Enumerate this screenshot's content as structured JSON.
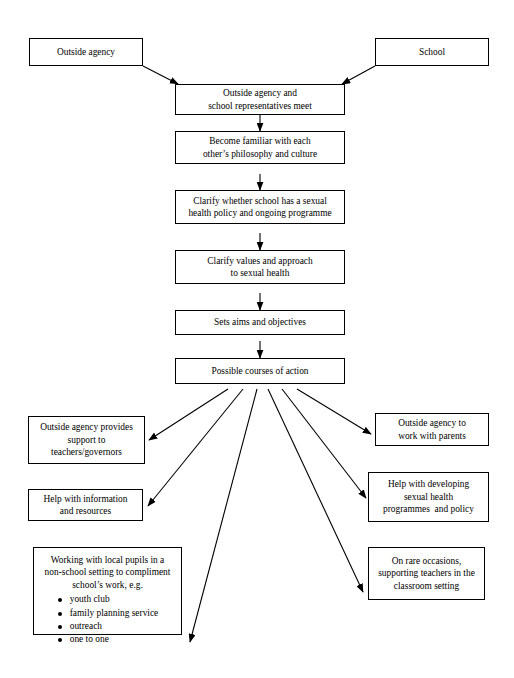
{
  "diagram": {
    "stroke_color": "#000000",
    "fill_color": "#ffffff",
    "nodes": {
      "outside_agency": {
        "lines": [
          "Outside agency"
        ]
      },
      "school": {
        "lines": [
          "School"
        ]
      },
      "meet": {
        "lines": [
          "Outside agency and",
          "school representatives meet"
        ]
      },
      "familiar": {
        "lines": [
          "Become familiar with each",
          "other’s philosophy and culture"
        ]
      },
      "clarify_policy": {
        "lines": [
          "Clarify whether school has a sexual",
          "health policy and ongoing programme"
        ]
      },
      "clarify_values": {
        "lines": [
          "Clarify values and approach",
          "to sexual health"
        ]
      },
      "aims": {
        "lines": [
          "Sets aims and objectives"
        ]
      },
      "possible": {
        "lines": [
          "Possible courses of action"
        ]
      },
      "support_teachers": {
        "lines": [
          "Outside agency provides",
          "support to",
          "teachers/governors"
        ]
      },
      "help_information": {
        "lines": [
          "Help with information",
          "and resources"
        ]
      },
      "working_local": {
        "lines": [
          "Working with local pupils in a",
          "non-school setting to compliment",
          "school’s work, e.g."
        ],
        "bullets": [
          "youth club",
          "family planning service",
          "outreach",
          "one to one"
        ]
      },
      "work_parents": {
        "lines": [
          "Outside agency to",
          "work with parents"
        ]
      },
      "help_developing": {
        "lines": [
          "Help with developing",
          "sexual health",
          "programmes  and policy"
        ]
      },
      "rare_occasions": {
        "lines": [
          "On rare occasions,",
          "supporting teachers in the",
          "classroom setting"
        ]
      }
    }
  }
}
